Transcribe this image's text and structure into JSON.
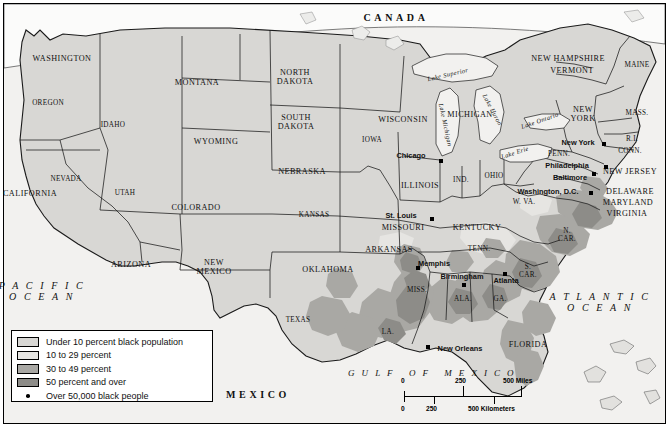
{
  "map": {
    "title": "Black Population Distribution Map of the United States",
    "base_fill": "#d8d7d4",
    "ocean_fill": "#f2f1ef",
    "border_color": "#000000",
    "shades": {
      "under10": "#d8d7d4",
      "pct10_29": "#e6e5e2",
      "pct30_49": "#a9a8a4",
      "pct50plus": "#8d8c88"
    }
  },
  "countries": [
    {
      "name": "canada-label",
      "text": "CANADA",
      "x": 396,
      "y": 18
    },
    {
      "name": "mexico-label",
      "text": "MEXICO",
      "x": 258,
      "y": 395
    }
  ],
  "oceans": [
    {
      "name": "pacific-ocean-label",
      "line1": "P A C I F I C",
      "line2": "O C E A N",
      "x": 42,
      "y": 291
    },
    {
      "name": "atlantic-ocean-label",
      "line1": "A T L A N T I C",
      "line2": "O C E A N",
      "x": 600,
      "y": 302
    },
    {
      "name": "gulf-of-mexico-label",
      "text": "G U L F   O F   M E X I C O",
      "x": 432,
      "y": 374
    }
  ],
  "lakes": [
    {
      "name": "lake-superior",
      "text": "Lake Superior",
      "x": 448,
      "y": 75,
      "rot": -13
    },
    {
      "name": "lake-michigan",
      "text": "Lake Michigan",
      "x": 445,
      "y": 125,
      "rot": 78
    },
    {
      "name": "lake-huron",
      "text": "Lake Huron",
      "x": 492,
      "y": 110,
      "rot": 62
    },
    {
      "name": "lake-erie",
      "text": "Lake Erie",
      "x": 515,
      "y": 153,
      "rot": -18
    },
    {
      "name": "lake-ontario",
      "text": "Lake Ontario",
      "x": 540,
      "y": 121,
      "rot": -19
    }
  ],
  "states": [
    {
      "name": "washington",
      "text": "WASHINGTON",
      "x": 62,
      "y": 59
    },
    {
      "name": "oregon",
      "text": "OREGON",
      "x": 48,
      "y": 104
    },
    {
      "name": "idaho",
      "text": "IDAHO",
      "x": 113,
      "y": 126
    },
    {
      "name": "montana",
      "text": "MONTANA",
      "x": 197,
      "y": 83
    },
    {
      "name": "north-dakota",
      "text": "NORTH\nDAKOTA",
      "x": 295,
      "y": 78
    },
    {
      "name": "south-dakota",
      "text": "SOUTH\nDAKOTA",
      "x": 296,
      "y": 123
    },
    {
      "name": "wyoming",
      "text": "WYOMING",
      "x": 216,
      "y": 142
    },
    {
      "name": "nebraska",
      "text": "NEBRASKA",
      "x": 302,
      "y": 172
    },
    {
      "name": "nevada",
      "text": "NEVADA",
      "x": 66,
      "y": 180
    },
    {
      "name": "california",
      "text": "CALIFORNIA",
      "x": 30,
      "y": 194
    },
    {
      "name": "utah",
      "text": "UTAH",
      "x": 125,
      "y": 194
    },
    {
      "name": "colorado",
      "text": "COLORADO",
      "x": 196,
      "y": 208
    },
    {
      "name": "kansas",
      "text": "KANSAS",
      "x": 314,
      "y": 216
    },
    {
      "name": "iowa",
      "text": "IOWA",
      "x": 372,
      "y": 141
    },
    {
      "name": "missouri",
      "text": "MISSOURI",
      "x": 403,
      "y": 228
    },
    {
      "name": "illinois",
      "text": "ILLINOIS",
      "x": 420,
      "y": 186
    },
    {
      "name": "wisconsin",
      "text": "WISCONSIN",
      "x": 403,
      "y": 120
    },
    {
      "name": "michigan",
      "text": "MICHIGAN",
      "x": 470,
      "y": 115
    },
    {
      "name": "indiana",
      "text": "IND.",
      "x": 461,
      "y": 181
    },
    {
      "name": "ohio",
      "text": "OHIO",
      "x": 494,
      "y": 177
    },
    {
      "name": "kentucky",
      "text": "KENTUCKY",
      "x": 477,
      "y": 228
    },
    {
      "name": "tennessee",
      "text": "TENN.",
      "x": 479,
      "y": 250
    },
    {
      "name": "arizona",
      "text": "ARIZONA",
      "x": 131,
      "y": 265
    },
    {
      "name": "new-mexico",
      "text": "NEW\nMEXICO",
      "x": 214,
      "y": 268
    },
    {
      "name": "oklahoma",
      "text": "OKLAHOMA",
      "x": 328,
      "y": 270
    },
    {
      "name": "texas",
      "text": "TEXAS",
      "x": 298,
      "y": 321
    },
    {
      "name": "arkansas",
      "text": "ARKANSAS",
      "x": 389,
      "y": 250
    },
    {
      "name": "mississippi",
      "text": "MISS.",
      "x": 417,
      "y": 291
    },
    {
      "name": "louisiana",
      "text": "LA.",
      "x": 388,
      "y": 333
    },
    {
      "name": "alabama",
      "text": "ALA.",
      "x": 463,
      "y": 300
    },
    {
      "name": "georgia",
      "text": "GA.",
      "x": 500,
      "y": 300
    },
    {
      "name": "florida",
      "text": "FLORIDA",
      "x": 528,
      "y": 345
    },
    {
      "name": "south-carolina",
      "text": "S.\nCAR.",
      "x": 528,
      "y": 272
    },
    {
      "name": "north-carolina",
      "text": "N.\nCAR.",
      "x": 567,
      "y": 236
    },
    {
      "name": "virginia",
      "text": "VIRGINIA",
      "x": 627,
      "y": 214
    },
    {
      "name": "west-virginia",
      "text": "W. VA.",
      "x": 524,
      "y": 203
    },
    {
      "name": "maryland",
      "text": "MARYLAND",
      "x": 628,
      "y": 203
    },
    {
      "name": "delaware",
      "text": "DELAWARE",
      "x": 630,
      "y": 192
    },
    {
      "name": "pennsylvania",
      "text": "PENN.",
      "x": 559,
      "y": 155
    },
    {
      "name": "new-jersey",
      "text": "NEW JERSEY",
      "x": 630,
      "y": 172
    },
    {
      "name": "new-york",
      "text": "NEW\nYORK",
      "x": 583,
      "y": 115
    },
    {
      "name": "connecticut",
      "text": "CONN.",
      "x": 630,
      "y": 152
    },
    {
      "name": "rhode-island",
      "text": "R.I.",
      "x": 632,
      "y": 140
    },
    {
      "name": "massachusetts",
      "text": "MASS.",
      "x": 637,
      "y": 114
    },
    {
      "name": "vermont",
      "text": "VERMONT",
      "x": 572,
      "y": 71
    },
    {
      "name": "new-hampshire",
      "text": "NEW HAMPSHIRE",
      "x": 568,
      "y": 59
    },
    {
      "name": "maine",
      "text": "MAINE",
      "x": 637,
      "y": 66
    }
  ],
  "cities": [
    {
      "name": "chicago",
      "text": "Chicago",
      "tx": 411,
      "ty": 156,
      "dx": 441,
      "dy": 161
    },
    {
      "name": "st-louis",
      "text": "St. Louis",
      "tx": 401,
      "ty": 216,
      "dx": 432,
      "dy": 219
    },
    {
      "name": "memphis",
      "text": "Memphis",
      "tx": 434,
      "ty": 264,
      "dx": 418,
      "dy": 268
    },
    {
      "name": "birmingham",
      "text": "Birmingham",
      "tx": 462,
      "ty": 277,
      "dx": 464,
      "dy": 285
    },
    {
      "name": "atlanta",
      "text": "Atlanta",
      "tx": 506,
      "ty": 281,
      "dx": 505,
      "dy": 274
    },
    {
      "name": "new-orleans",
      "text": "New Orleans",
      "tx": 460,
      "ty": 349,
      "dx": 428,
      "dy": 347
    },
    {
      "name": "washington-dc",
      "text": "Washington, D.C.",
      "tx": 548,
      "ty": 192,
      "dx": 591,
      "dy": 193
    },
    {
      "name": "baltimore",
      "text": "Baltimore",
      "tx": 570,
      "ty": 178,
      "dx": 594,
      "dy": 174
    },
    {
      "name": "philadelphia",
      "text": "Philadelphia",
      "tx": 567,
      "ty": 166,
      "dx": 606,
      "dy": 167
    },
    {
      "name": "new-york-city",
      "text": "New York",
      "tx": 578,
      "ty": 143,
      "dx": 604,
      "dy": 144
    }
  ],
  "legend": {
    "name": "map-legend",
    "items": [
      {
        "label": "Under 10 percent black population",
        "color": "#d8d7d4",
        "swatch": true
      },
      {
        "label": "10 to 29 percent",
        "color": "#e6e5e2",
        "swatch": true
      },
      {
        "label": "30 to 49 percent",
        "color": "#a9a8a4",
        "swatch": true
      },
      {
        "label": "50 percent and over",
        "color": "#8d8c88",
        "swatch": true
      },
      {
        "label": "Over 50,000 black people",
        "color": "#000000",
        "swatch": false
      }
    ]
  },
  "scale": {
    "name": "scale-bar",
    "miles": {
      "zero": "0",
      "mid": "250",
      "end": "500 Miles"
    },
    "kilometers": {
      "zero": "0",
      "mid": "250",
      "end": "500 Kilometers"
    }
  }
}
